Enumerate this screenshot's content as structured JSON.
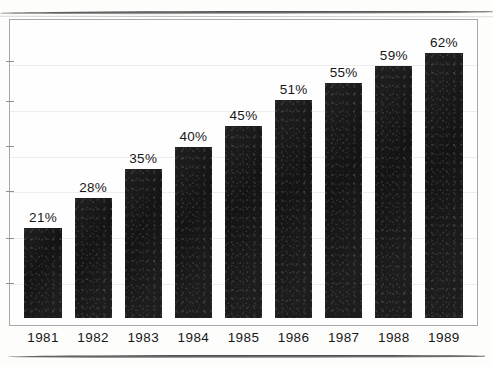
{
  "chart_data": {
    "type": "bar",
    "title": "",
    "subtitle": "",
    "xlabel": "",
    "ylabel": "",
    "categories": [
      "1981",
      "1982",
      "1983",
      "1984",
      "1985",
      "1986",
      "1987",
      "1988",
      "1989"
    ],
    "values": [
      21,
      28,
      35,
      40,
      45,
      51,
      55,
      59,
      62
    ],
    "data_labels": [
      "21%",
      "28%",
      "35%",
      "40%",
      "45%",
      "51%",
      "55%",
      "59%",
      "62%"
    ],
    "value_unit": "%",
    "ylim": [
      0,
      70
    ],
    "y_tick_values": [
      10,
      20,
      30,
      40,
      50,
      60
    ],
    "y_tick_labels_shown": false,
    "grid": true,
    "grid_orientation": "horizontal",
    "legend": null,
    "legend_position": "none",
    "series": [
      {
        "name": "",
        "values": [
          21,
          28,
          35,
          40,
          45,
          51,
          55,
          59,
          62
        ]
      }
    ],
    "bar_color": "#141414",
    "frame_color": "#a7a7a7",
    "grid_color": "#ededed",
    "text_color": "#171717",
    "background_color": "#fefefe"
  },
  "artifacts": {
    "top_edge_line": "scan-edge-shadow",
    "bottom_rule": "page-rule"
  }
}
